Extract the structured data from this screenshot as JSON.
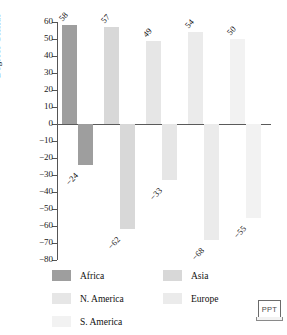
{
  "chart_data": {
    "type": "bar",
    "title": "",
    "xlabel": "",
    "ylabel": "Degrees Celsius",
    "ylim": [
      -80,
      60
    ],
    "ytick_step": 10,
    "yticks": [
      60,
      50,
      40,
      30,
      20,
      10,
      0,
      -10,
      -20,
      -30,
      -40,
      -50,
      -60,
      -70,
      -80
    ],
    "ytick_labels": [
      "60",
      "50",
      "40",
      "30",
      "20",
      "10",
      "0",
      "−10",
      "−20",
      "−30",
      "−40",
      "−50",
      "−60",
      "−70",
      "−80"
    ],
    "grid": false,
    "legend_position": "bottom",
    "categories": [
      "Africa",
      "Asia",
      "N. America",
      "Europe",
      "S. America"
    ],
    "series": [
      {
        "name": "maximum",
        "values": [
          58,
          57,
          49,
          54,
          50
        ],
        "labels": [
          "58",
          "57",
          "49",
          "54",
          "50"
        ]
      },
      {
        "name": "minimum",
        "values": [
          -24,
          -62,
          -33,
          -68,
          -55
        ],
        "labels": [
          "−24",
          "−62",
          "−33",
          "−68",
          "−55"
        ]
      }
    ],
    "colors": [
      "#9e9e9e",
      "#d8d8d8",
      "#e6e6e6",
      "#ebebeb",
      "#f2f2f2"
    ]
  },
  "axis": {
    "y_title": "Degrees Celsius"
  },
  "legend": {
    "items": [
      {
        "label": "Africa",
        "color": "#9e9e9e"
      },
      {
        "label": "Asia",
        "color": "#d8d8d8"
      },
      {
        "label": "N. America",
        "color": "#e6e6e6"
      },
      {
        "label": "Europe",
        "color": "#ebebeb"
      },
      {
        "label": "S. America",
        "color": "#f2f2f2"
      }
    ]
  },
  "badge": {
    "text": "PPT",
    "icon": "laptop-icon"
  }
}
